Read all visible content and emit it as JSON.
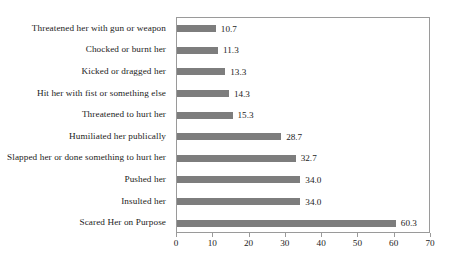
{
  "chart_data": {
    "type": "bar",
    "orientation": "horizontal",
    "title": "",
    "xlabel": "",
    "ylabel": "",
    "xlim": [
      0,
      70
    ],
    "xticks": [
      0,
      10,
      20,
      30,
      40,
      50,
      60,
      70
    ],
    "grid": false,
    "legend": null,
    "bar_color": "#7d7d7d",
    "border_color": "#9a9a9a",
    "background": "#ffffff",
    "categories": [
      "Threatened her with gun or weapon",
      "Chocked or burnt her",
      "Kicked or dragged her",
      "Hit her with fist or something else",
      "Threatened to hurt her",
      "Humiliated her publically",
      "Slapped her or done something to hurt her",
      "Pushed her",
      "Insulted her",
      "Scared Her on Purpose"
    ],
    "values": [
      10.7,
      11.3,
      13.3,
      14.3,
      15.3,
      28.7,
      32.7,
      34.0,
      34.0,
      60.3
    ],
    "value_labels": [
      "10.7",
      "11.3",
      "13.3",
      "14.3",
      "15.3",
      "28.7",
      "32.7",
      "34.0",
      "34.0",
      "60.3"
    ],
    "tick_labels": [
      "0",
      "10",
      "20",
      "30",
      "40",
      "50",
      "60",
      "70"
    ]
  }
}
